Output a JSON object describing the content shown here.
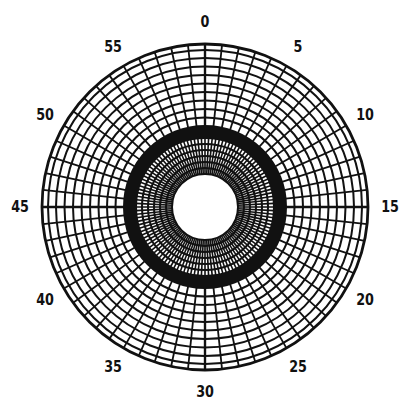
{
  "diagram": {
    "type": "polar-grid",
    "center": [
      205,
      207
    ],
    "colors": {
      "ink": "#111111",
      "paper": "#ffffff"
    },
    "outer_radius": 163,
    "hole_radius": 33,
    "band": {
      "inner_radius": 69,
      "outer_radius": 81
    },
    "inner_zone": {
      "rings": [
        33,
        39,
        45,
        51,
        57,
        63,
        69
      ],
      "spokes": 120
    },
    "outer_zone": {
      "rings": [
        81,
        89.5,
        98,
        106.5,
        115,
        123.5,
        132,
        140.5,
        149,
        157,
        163
      ],
      "spokes": 60
    },
    "label_radius": 185,
    "labels": [
      {
        "text": "0",
        "minute": 0
      },
      {
        "text": "5",
        "minute": 5
      },
      {
        "text": "10",
        "minute": 10
      },
      {
        "text": "15",
        "minute": 15
      },
      {
        "text": "20",
        "minute": 20
      },
      {
        "text": "25",
        "minute": 25
      },
      {
        "text": "30",
        "minute": 30
      },
      {
        "text": "35",
        "minute": 35
      },
      {
        "text": "40",
        "minute": 40
      },
      {
        "text": "45",
        "minute": 45
      },
      {
        "text": "50",
        "minute": 50
      },
      {
        "text": "55",
        "minute": 55
      }
    ]
  }
}
